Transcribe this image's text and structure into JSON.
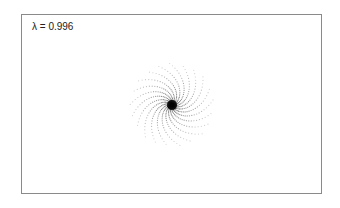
{
  "chart_data": {
    "type": "scatter",
    "title": "",
    "annotation": "λ = 0.996",
    "xlabel": "",
    "ylabel": "",
    "grid": false,
    "legend": null,
    "points": {
      "count": 600,
      "lambda": 0.996,
      "center": [
        150,
        90
      ],
      "max_radius": 42,
      "core_radius": 5
    },
    "colors": {
      "points": "#000000",
      "frame": "#8a8a8a"
    }
  }
}
